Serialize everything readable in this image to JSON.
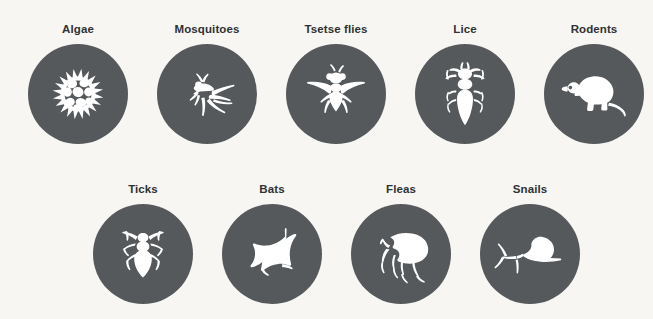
{
  "page": {
    "background_color": "#f8f6f3",
    "disc_color": "#55595b",
    "icon_color": "#ffffff",
    "label_color": "#2e3234"
  },
  "rows": [
    {
      "row_name": "top-row",
      "items": [
        {
          "label": "Algae",
          "icon": "algae-icon",
          "x": 13,
          "y": 22
        },
        {
          "label": "Mosquitoes",
          "icon": "mosquito-icon",
          "x": 142,
          "y": 22
        },
        {
          "label": "Tsetse flies",
          "icon": "tsetse-fly-icon",
          "x": 271,
          "y": 22
        },
        {
          "label": "Lice",
          "icon": "louse-icon",
          "x": 400,
          "y": 22
        },
        {
          "label": "Rodents",
          "icon": "rodent-icon",
          "x": 529,
          "y": 22
        }
      ]
    },
    {
      "row_name": "bottom-row",
      "items": [
        {
          "label": "Ticks",
          "icon": "tick-icon",
          "x": 78,
          "y": 182
        },
        {
          "label": "Bats",
          "icon": "bat-icon",
          "x": 207,
          "y": 182
        },
        {
          "label": "Fleas",
          "icon": "flea-icon",
          "x": 336,
          "y": 182
        },
        {
          "label": "Snails",
          "icon": "snail-icon",
          "x": 465,
          "y": 182
        }
      ]
    }
  ]
}
